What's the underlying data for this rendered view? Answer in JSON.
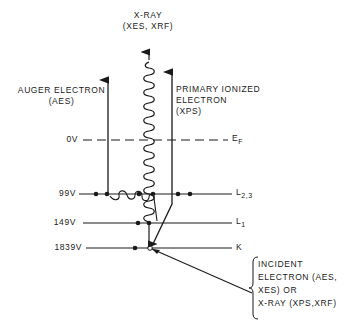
{
  "diagram": {
    "title_xray": [
      "X-RAY",
      "(XES, XRF)"
    ],
    "auger": [
      "AUGER ELECTRON",
      "(AES)"
    ],
    "primary": [
      "PRIMARY IONIZED",
      "ELECTRON",
      "(XPS)"
    ],
    "levels": [
      {
        "voltage": "0V",
        "name": "E",
        "sub": "F",
        "dashed": true
      },
      {
        "voltage": "99V",
        "name": "L",
        "sub": "2,3",
        "dashed": false
      },
      {
        "voltage": "149V",
        "name": "L",
        "sub": "1",
        "dashed": false
      },
      {
        "voltage": "1839V",
        "name": "K",
        "sub": "",
        "dashed": false
      }
    ],
    "incident": [
      "INCIDENT",
      "ELECTRON (AES,",
      "XES) OR",
      "X-RAY (XPS,XRF)"
    ]
  }
}
